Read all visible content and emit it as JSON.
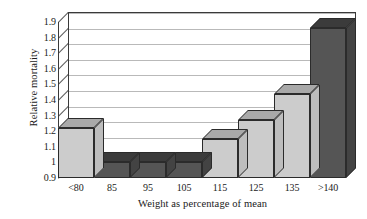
{
  "chart_data": {
    "type": "bar",
    "title": "",
    "xlabel": "Weight as percentage of mean",
    "ylabel": "Relative mortality",
    "categories": [
      "<80",
      "85",
      "95",
      "105",
      "115",
      "125",
      "135",
      ">140"
    ],
    "values": [
      1.22,
      1.0,
      1.0,
      1.0,
      1.15,
      1.27,
      1.44,
      1.86
    ],
    "series": [
      {
        "name": "Relative mortality",
        "values": [
          1.22,
          1.0,
          1.0,
          1.0,
          1.15,
          1.27,
          1.44,
          1.86
        ]
      }
    ],
    "bar_shades": [
      "light",
      "dark",
      "dark",
      "dark",
      "light",
      "light",
      "light",
      "dark"
    ],
    "ylim": [
      0.9,
      1.9
    ],
    "ytick_labels": [
      "1.9",
      "1.8",
      "1.7",
      "1.6",
      "1.5",
      "1.4",
      "1.3",
      "1.2",
      "1.1",
      "1",
      "0.9"
    ],
    "ytick_values": [
      1.9,
      1.8,
      1.7,
      1.6,
      1.5,
      1.4,
      1.3,
      1.2,
      1.1,
      1.0,
      0.9
    ],
    "grid": true,
    "legend": "none",
    "style_3d": true,
    "colors": {
      "bar_light_face": "#cccccc",
      "bar_light_top": "#a9a9a9",
      "bar_light_side": "#bdbdbd",
      "bar_dark_face": "#555555",
      "bar_dark_top": "#3b3b3b",
      "bar_dark_side": "#434343",
      "gridline": "#b9b9b9",
      "axis": "#3a3a3a",
      "background": "#ffffff",
      "text": "#1a1a1a"
    }
  }
}
